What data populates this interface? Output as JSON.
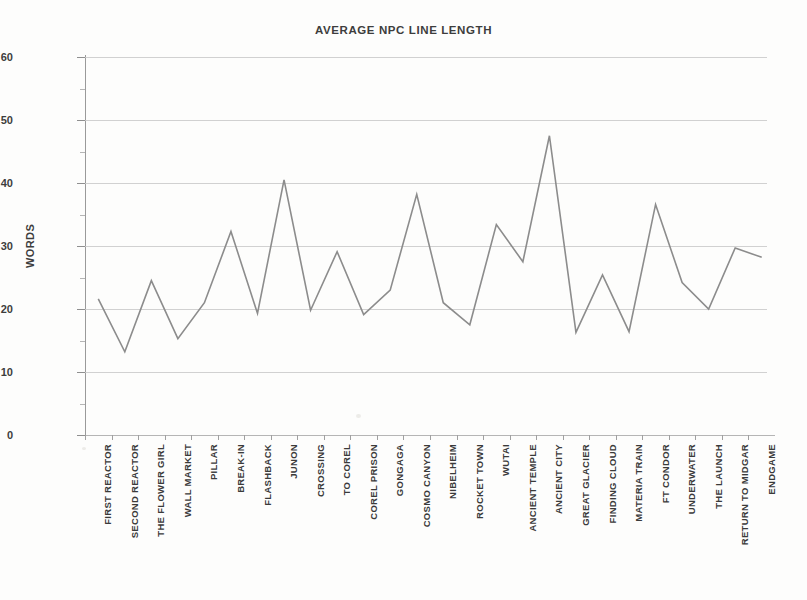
{
  "chart_data": {
    "type": "line",
    "title": "AVERAGE NPC LINE LENGTH",
    "xlabel": "",
    "ylabel": "WORDS",
    "ylim": [
      0,
      60
    ],
    "ytick_step": 10,
    "yticks": [
      0,
      10,
      20,
      30,
      40,
      50,
      60
    ],
    "grid": true,
    "legend": "none",
    "line_color": "#8c8c8c",
    "background_color": "#fdfdfc",
    "gridline_color": "#c9c9c9",
    "categories": [
      "FIRST REACTOR",
      "SECOND REACTOR",
      "THE FLOWER GIRL",
      "WALL MARKET",
      "PILLAR",
      "BREAK-IN",
      "FLASHBACK",
      "JUNON",
      "CROSSING",
      "TO COREL",
      "COREL PRISON",
      "GONGAGA",
      "COSMO CANYON",
      "NIBELHEIM",
      "ROCKET TOWN",
      "WUTAI",
      "ANCIENT TEMPLE",
      "ANCIENT CITY",
      "GREAT GLACIER",
      "FINDING CLOUD",
      "MATERIA TRAIN",
      "FT CONDOR",
      "UNDERWATER",
      "THE LAUNCH",
      "RETURN TO MIDGAR",
      "ENDGAME"
    ],
    "values": [
      21.6,
      13.2,
      24.5,
      15.3,
      21.0,
      32.3,
      19.3,
      40.5,
      19.8,
      29.1,
      19.1,
      23.0,
      38.2,
      21.0,
      17.5,
      33.4,
      27.5,
      47.5,
      16.3,
      25.4,
      16.4,
      36.6,
      24.2,
      20.0,
      29.7,
      28.2
    ]
  }
}
